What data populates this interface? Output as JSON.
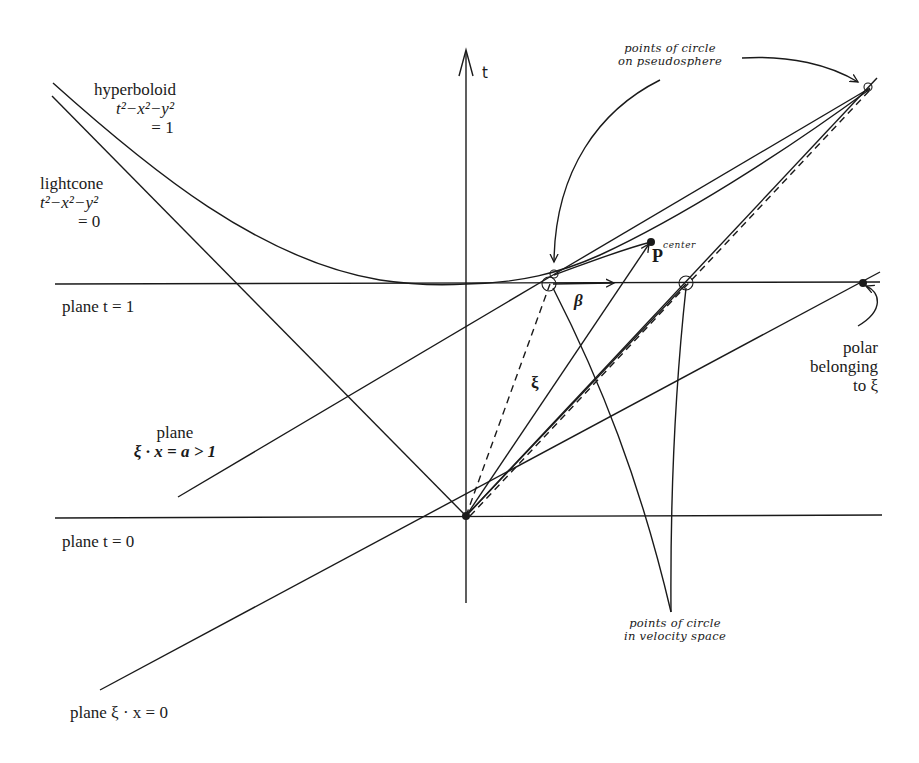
{
  "labels": {
    "hyperboloid": {
      "name": "hyperboloid",
      "eq1": "t²−x²−y²",
      "eq2": "= 1"
    },
    "lightcone": {
      "name": "lightcone",
      "eq1": "t²−x²−y²",
      "eq2": "= 0"
    },
    "plane_t1": "plane t = 1",
    "plane_xi_a": {
      "line1": "plane",
      "line2": "ξ · x = a > 1"
    },
    "plane_t0": "plane t = 0",
    "plane_xi_0": "plane ξ · x = 0",
    "axis_t": "t",
    "pseudosphere_note": {
      "line1": "points of circle",
      "line2": "on pseudosphere"
    },
    "velocity_note": {
      "line1": "points of circle",
      "line2": "in velocity space"
    },
    "center_point": "P",
    "center_label": "center",
    "beta": "β",
    "xi": "ξ",
    "polar_note": {
      "line1": "polar",
      "line2": "belonging",
      "line3": "to ξ"
    }
  },
  "colors": {
    "ink": "#1a1a1a",
    "background": "#ffffff"
  }
}
